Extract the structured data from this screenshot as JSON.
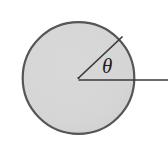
{
  "figure": {
    "type": "geometry-diagram",
    "canvas": {
      "width": 168,
      "height": 142,
      "background_color": "#ffffff"
    },
    "circle": {
      "name": "shaded-circle",
      "center_x": 78.5,
      "center_y": 78.0,
      "radius": 56.5,
      "fill_color": "#d6d6d6",
      "fill_texture": "halftone-dither",
      "stroke_color": "#565656",
      "stroke_width": 2.2
    },
    "radius_line": {
      "name": "angled-radius-line",
      "x1": 78.5,
      "y1": 78.0,
      "x2": 122.0,
      "y2": 37.0,
      "angle_degrees": 43,
      "stroke_color": "#3a3a3a",
      "stroke_width": 1.7
    },
    "baseline": {
      "name": "horizontal-baseline",
      "x1": 78.5,
      "y1": 80.0,
      "x2": 168.0,
      "y2": 80.0,
      "stroke_color": "#3a3a3a",
      "stroke_width": 1.7
    },
    "angle_label": {
      "text": "θ",
      "symbol_name": "theta",
      "x": 102,
      "y": 56,
      "font_size": 21,
      "color": "#1c1c1c"
    }
  }
}
